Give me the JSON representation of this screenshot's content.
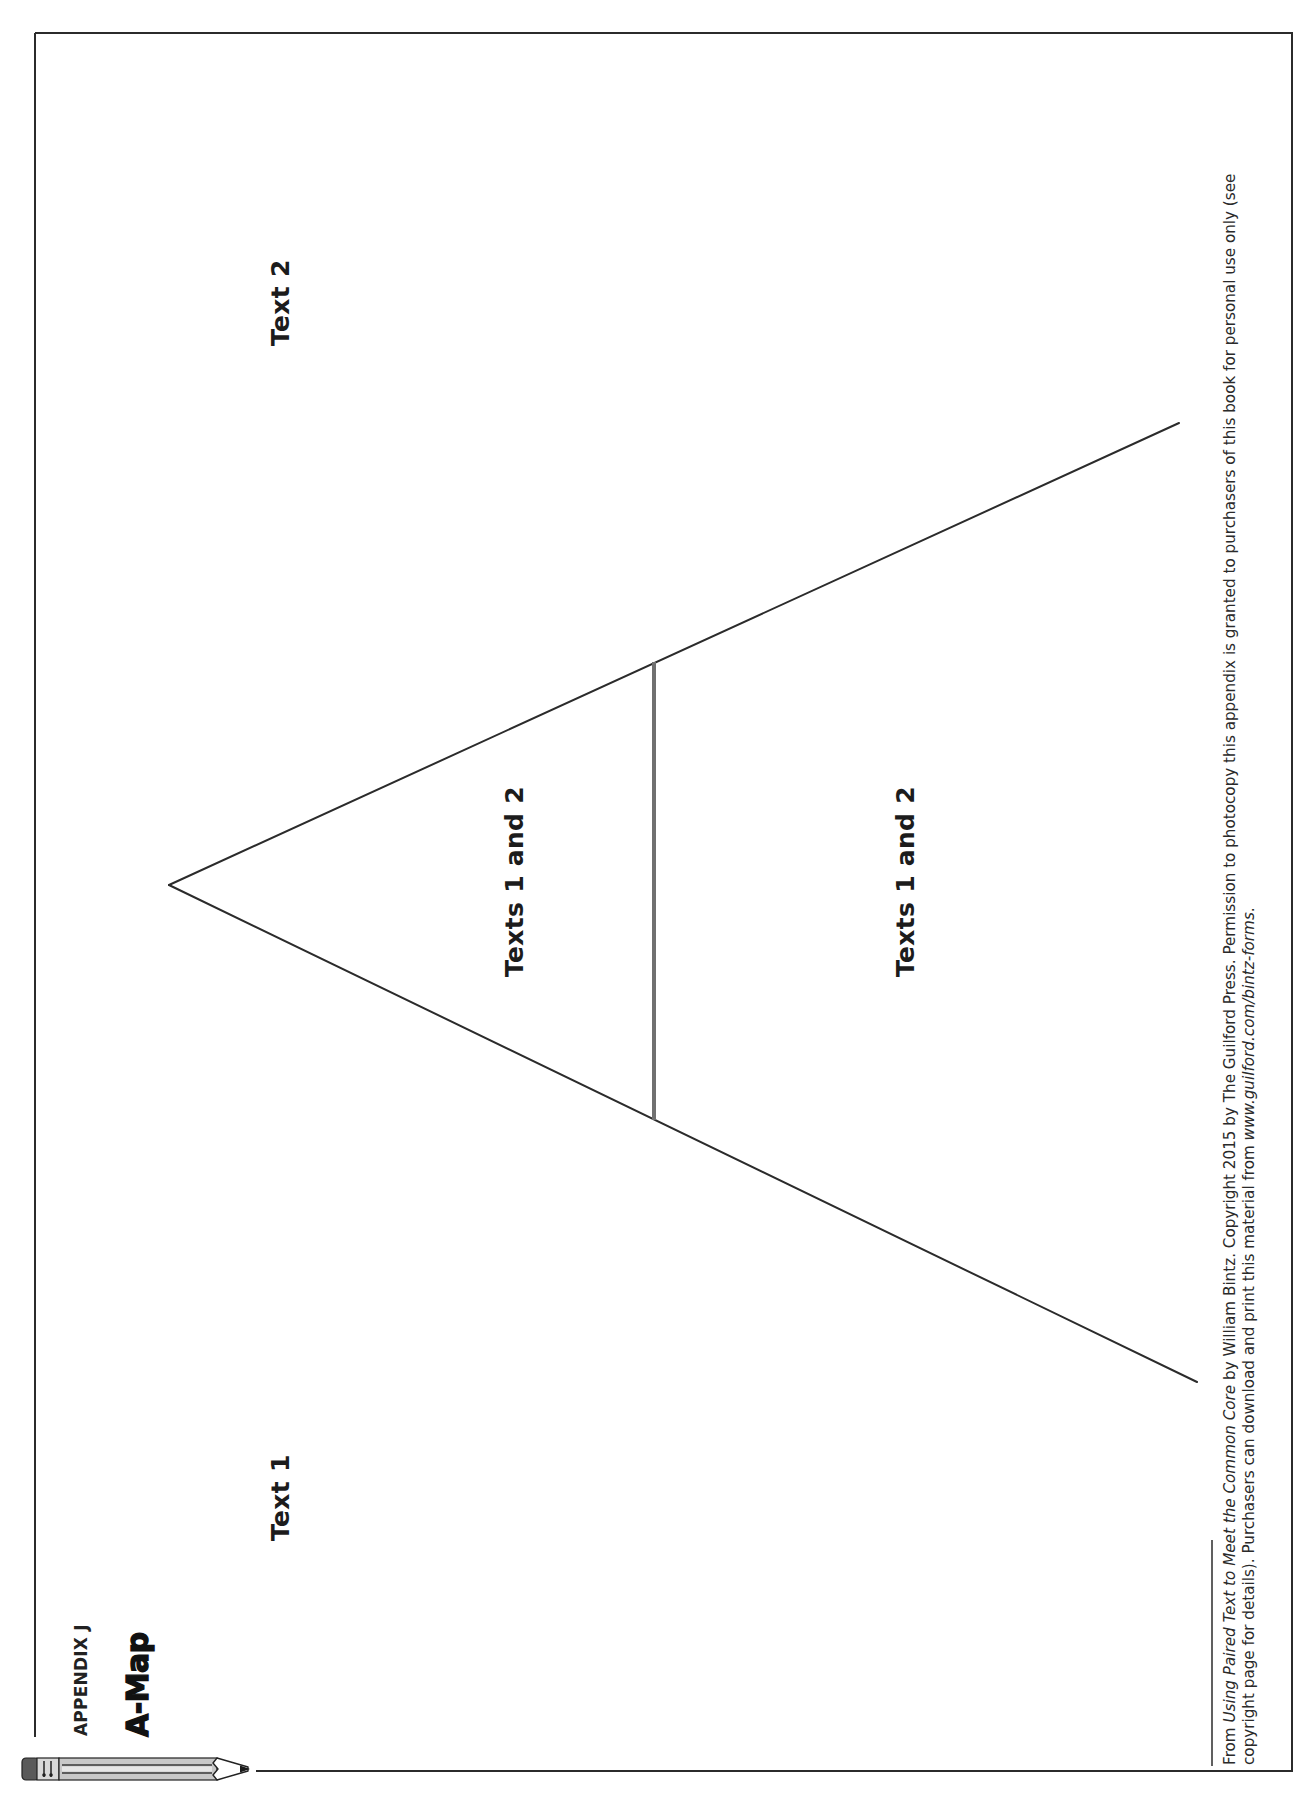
{
  "header": {
    "kicker": "APPENDIX J",
    "title": "A-Map"
  },
  "diagram": {
    "type": "A-map graphic organizer",
    "labels": {
      "text1": "Text 1",
      "text2": "Text 2",
      "inner_left": "Texts 1 and 2",
      "inner_right": "Texts 1 and 2"
    },
    "colors": {
      "line": "#2b2b2b",
      "crossbar": "#707070",
      "border": "#2b2b2b"
    }
  },
  "footer": {
    "line1_prefix": "From ",
    "line1_book_title": "Using Paired Text to Meet the Common Core",
    "line1_suffix": " by William Bintz. Copyright 2015 by The Guilford Press. Permission to photocopy this appendix is granted to purchasers of this book for personal use only (see",
    "line2_prefix": "copyright page for details). Purchasers can download and print this material from ",
    "line2_url": "www.guilford.com/bintz-forms",
    "line2_suffix": "."
  },
  "icons": {
    "pencil": "pencil-icon"
  }
}
